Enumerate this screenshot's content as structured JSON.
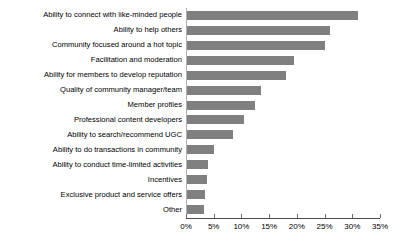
{
  "chart_data": {
    "type": "bar",
    "orientation": "horizontal",
    "title": "",
    "xlabel": "",
    "ylabel": "",
    "xlim": [
      0,
      35
    ],
    "grid": false,
    "legend": false,
    "tick_labels": [
      "0%",
      "5%",
      "10%",
      "15%",
      "20%",
      "25%",
      "30%",
      "35%"
    ],
    "tick_values": [
      0,
      5,
      10,
      15,
      20,
      25,
      30,
      35
    ],
    "bar_color": "#808080",
    "categories": [
      "Ability to connect with like-minded people",
      "Ability to help others",
      "Community focused around a hot topic",
      "Facilitation and moderation",
      "Ability for members to develop reputation",
      "Quality of community manager/team",
      "Member profiles",
      "Professional content developers",
      "Ability to search/recommend UGC",
      "Ability to do transactions in community",
      "Ability to conduct time-limited activities",
      "Incentives",
      "Exclusive product and service offers",
      "Other"
    ],
    "values": [
      31,
      26,
      25,
      19.5,
      18,
      13.5,
      12.5,
      10.5,
      8.5,
      5,
      4,
      3.8,
      3.5,
      3.2
    ]
  }
}
